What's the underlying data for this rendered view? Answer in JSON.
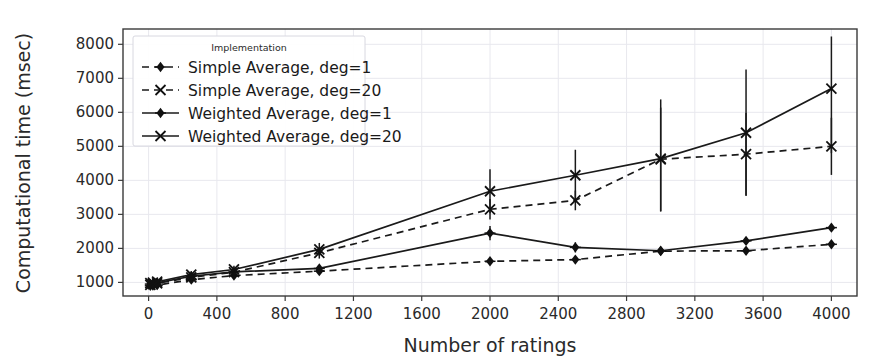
{
  "chart_data": {
    "type": "line",
    "title": "",
    "xlabel": "Number of ratings",
    "ylabel": "Computational time (msec)",
    "xlim": [
      -150,
      4150
    ],
    "ylim": [
      600,
      8450
    ],
    "xticks": [
      0,
      400,
      800,
      1200,
      1600,
      2000,
      2400,
      2800,
      3200,
      3600,
      4000
    ],
    "yticks": [
      1000,
      2000,
      3000,
      4000,
      5000,
      6000,
      7000,
      8000
    ],
    "grid": true,
    "legend_position": "upper-left",
    "legend_title": "Implementation",
    "x": [
      10,
      25,
      50,
      250,
      500,
      1000,
      2000,
      2500,
      3000,
      3500,
      4000
    ],
    "series": [
      {
        "name": "Simple Average, deg=1",
        "linestyle": "dashed",
        "marker": "diamond",
        "values": [
          900,
          905,
          920,
          1080,
          1200,
          1330,
          1620,
          1670,
          1920,
          1930,
          2120
        ],
        "err_low": [
          840,
          845,
          860,
          1010,
          1130,
          1260,
          1540,
          1590,
          1840,
          1850,
          2040
        ],
        "err_high": [
          960,
          965,
          980,
          1150,
          1270,
          1400,
          1700,
          1750,
          2000,
          2010,
          2200
        ]
      },
      {
        "name": "Simple Average, deg=20",
        "linestyle": "dashed",
        "marker": "x",
        "values": [
          930,
          950,
          975,
          1150,
          1300,
          1870,
          3150,
          3410,
          4620,
          4770,
          5000
        ],
        "err_low": [
          870,
          890,
          915,
          1060,
          1200,
          1700,
          2850,
          3120,
          3100,
          3560,
          4160
        ],
        "err_high": [
          990,
          1010,
          1035,
          1240,
          1400,
          2040,
          3450,
          3700,
          6140,
          5980,
          5840
        ]
      },
      {
        "name": "Weighted Average, deg=1",
        "linestyle": "solid",
        "marker": "diamond",
        "values": [
          950,
          960,
          985,
          1180,
          1310,
          1410,
          2450,
          2030,
          1930,
          2220,
          2610
        ],
        "err_low": [
          880,
          890,
          915,
          1100,
          1230,
          1330,
          2240,
          1880,
          1860,
          2130,
          2520
        ],
        "err_high": [
          1020,
          1030,
          1055,
          1260,
          1390,
          1490,
          2660,
          2180,
          2000,
          2310,
          2700
        ]
      },
      {
        "name": "Weighted Average, deg=20",
        "linestyle": "solid",
        "marker": "x",
        "values": [
          980,
          995,
          1020,
          1230,
          1380,
          1970,
          3680,
          4150,
          4640,
          5400,
          6700
        ],
        "err_low": [
          900,
          915,
          940,
          1130,
          1270,
          1780,
          3030,
          3400,
          3080,
          3540,
          4800
        ],
        "err_high": [
          1060,
          1075,
          1100,
          1330,
          1490,
          2160,
          4330,
          4900,
          6380,
          7260,
          8230
        ]
      }
    ]
  },
  "axis": {
    "ylabel": "Computational time (msec)",
    "xlabel": "Number of ratings",
    "ytick_labels": [
      "1000",
      "2000",
      "3000",
      "4000",
      "5000",
      "6000",
      "7000",
      "8000"
    ],
    "xtick_labels": [
      "0",
      "400",
      "800",
      "1200",
      "1600",
      "2000",
      "2400",
      "2800",
      "3200",
      "3600",
      "4000"
    ]
  },
  "legend": {
    "title": "Implementation",
    "entries": [
      {
        "label": "Simple Average, deg=1"
      },
      {
        "label": "Simple Average, deg=20"
      },
      {
        "label": "Weighted Average, deg=1"
      },
      {
        "label": "Weighted Average, deg=20"
      }
    ]
  },
  "colors": {
    "line": "#1a1a1a",
    "grid": "#e8e8ee",
    "axis": "#3a3a3a",
    "text": "#2a2a2a",
    "background": "#ffffff"
  }
}
